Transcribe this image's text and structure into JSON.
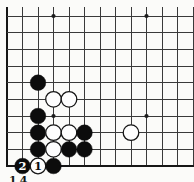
{
  "diagram": {
    "type": "go-board-corner",
    "caption_fragment": "14",
    "grid": {
      "cols": 13,
      "rows": 10,
      "col_start_x": 7,
      "row_start_y": 16,
      "col_spacing": 15.5,
      "row_spacing": 16.667,
      "line_top_overhang_y": 7,
      "thick_left_edge": true,
      "thick_bottom_edge": true
    },
    "star_points": [
      {
        "col": 3,
        "row": 0
      },
      {
        "col": 9,
        "row": 0
      },
      {
        "col": 3,
        "row": 6
      },
      {
        "col": 9,
        "row": 6
      }
    ],
    "stones": [
      {
        "col": 2,
        "row": 4,
        "color": "black",
        "label": ""
      },
      {
        "col": 3,
        "row": 5,
        "color": "white",
        "label": ""
      },
      {
        "col": 4,
        "row": 5,
        "color": "white",
        "label": ""
      },
      {
        "col": 2,
        "row": 6,
        "color": "black",
        "label": ""
      },
      {
        "col": 2,
        "row": 7,
        "color": "black",
        "label": ""
      },
      {
        "col": 3,
        "row": 7,
        "color": "white",
        "label": ""
      },
      {
        "col": 4,
        "row": 7,
        "color": "white",
        "label": ""
      },
      {
        "col": 5,
        "row": 7,
        "color": "black",
        "label": ""
      },
      {
        "col": 8,
        "row": 7,
        "color": "white",
        "label": ""
      },
      {
        "col": 2,
        "row": 8,
        "color": "black",
        "label": ""
      },
      {
        "col": 3,
        "row": 8,
        "color": "white",
        "label": ""
      },
      {
        "col": 4,
        "row": 8,
        "color": "black",
        "label": ""
      },
      {
        "col": 5,
        "row": 8,
        "color": "black",
        "label": ""
      },
      {
        "col": 1,
        "row": 9,
        "color": "black",
        "label": "2"
      },
      {
        "col": 2,
        "row": 9,
        "color": "white",
        "label": "1"
      },
      {
        "col": 3,
        "row": 9,
        "color": "black",
        "label": ""
      }
    ],
    "colors": {
      "background": "#fbfbf9",
      "line": "#3a3a3a",
      "edge_line": "#161616",
      "star": "#1c1c1c",
      "black_stone": "#0c0c0c",
      "white_stone": "#fefefe",
      "white_stone_outline": "#141414",
      "label_on_black": "#ffffff",
      "label_on_white": "#0c0c0c"
    }
  }
}
